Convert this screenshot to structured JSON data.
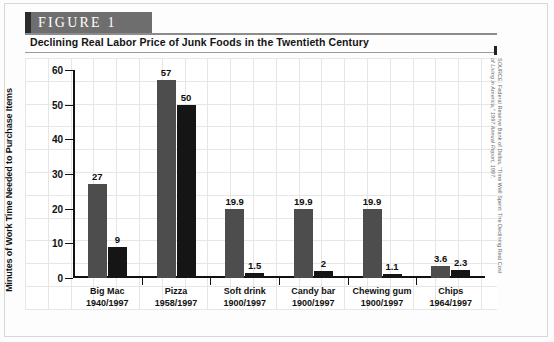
{
  "figure": {
    "banner_label": "FIGURE  1",
    "title": "Declining Real Labor Price of Junk Foods in the Twentieth Century",
    "source_line1": "SOURCE: Federal Reserve Bank of Dallas, “Time Well Spent: The Declining Real Cost",
    "source_line2": "of Living in America,” 1997 Annual Report, 1997."
  },
  "chart_data": {
    "type": "bar",
    "title": "Declining Real Labor Price of Junk Foods in the Twentieth Century",
    "xlabel": "",
    "ylabel": "Minutes of Work Time Needed to Purchase Items",
    "ylim": [
      0,
      60
    ],
    "yticks": [
      0,
      10,
      20,
      30,
      40,
      50,
      60
    ],
    "grid": true,
    "legend": "none",
    "categories": [
      "Big Mac",
      "Pizza",
      "Soft drink",
      "Candy bar",
      "Chewing gum",
      "Chips"
    ],
    "category_years": [
      "1940/1997",
      "1958/1997",
      "1900/1997",
      "1900/1997",
      "1900/1997",
      "1964/1997"
    ],
    "series": [
      {
        "name": "Earlier year",
        "color": "#4d4d4d",
        "values": [
          27,
          57,
          19.9,
          19.9,
          19.9,
          3.6
        ]
      },
      {
        "name": "1997",
        "color": "#151515",
        "values": [
          9,
          50,
          1.5,
          2,
          1.1,
          2.3
        ]
      }
    ],
    "value_labels": [
      [
        "27",
        "9"
      ],
      [
        "57",
        "50"
      ],
      [
        "19.9",
        "1.5"
      ],
      [
        "19.9",
        "2"
      ],
      [
        "19.9",
        "1.1"
      ],
      [
        "3.6",
        "2.3"
      ]
    ]
  },
  "colors": {
    "banner_bg": "#6e6e6e",
    "banner_edge": "#2b2b2b",
    "bar_light": "#4d4d4d",
    "bar_dark": "#151515",
    "axis": "#111111"
  }
}
